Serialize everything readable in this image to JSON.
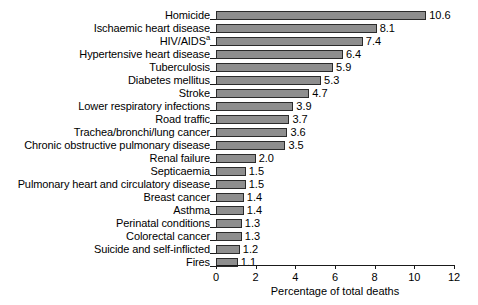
{
  "chart_data": {
    "type": "bar",
    "orientation": "horizontal",
    "title": "",
    "xlabel": "Percentage of total deaths",
    "ylabel": "",
    "xlim": [
      0,
      12
    ],
    "xticks": [
      "0",
      "2",
      "4",
      "6",
      "8",
      "10",
      "12"
    ],
    "xtick_values": [
      0,
      2,
      4,
      6,
      8,
      10,
      12
    ],
    "grid": false,
    "legend": false,
    "categories": [
      "Homicide",
      "Ischaemic heart disease",
      "HIV/AIDS",
      "Hypertensive heart disease",
      "Tuberculosis",
      "Diabetes mellitus",
      "Stroke",
      "Lower respiratory infections",
      "Road traffic",
      "Trachea/bronchi/lung cancer",
      "Chronic obstructive pulmonary disease",
      "Renal failure",
      "Septicaemia",
      "Pulmonary heart and circulatory disease",
      "Breast cancer",
      "Asthma",
      "Perinatal conditions",
      "Colorectal cancer",
      "Suicide and self-inflicted",
      "Fires"
    ],
    "values": [
      10.6,
      8.1,
      7.4,
      6.4,
      5.9,
      5.3,
      4.7,
      3.9,
      3.7,
      3.6,
      3.5,
      2.0,
      1.5,
      1.5,
      1.4,
      1.4,
      1.3,
      1.3,
      1.2,
      1.1
    ],
    "value_labels": [
      "10.6",
      "8.1",
      "7.4",
      "6.4",
      "5.9",
      "5.3",
      "4.7",
      "3.9",
      "3.7",
      "3.6",
      "3.5",
      "2.0",
      "1.5",
      "1.5",
      "1.4",
      "1.4",
      "1.3",
      "1.3",
      "1.2",
      "1.1"
    ],
    "footnote_markers": {
      "HIV/AIDS": "a"
    },
    "colors": {
      "bar_fill": "#8e8e8e",
      "bar_border": "#2b2b2b",
      "axis": "#1a1a1a",
      "text": "#000000",
      "background": "#ffffff"
    }
  }
}
